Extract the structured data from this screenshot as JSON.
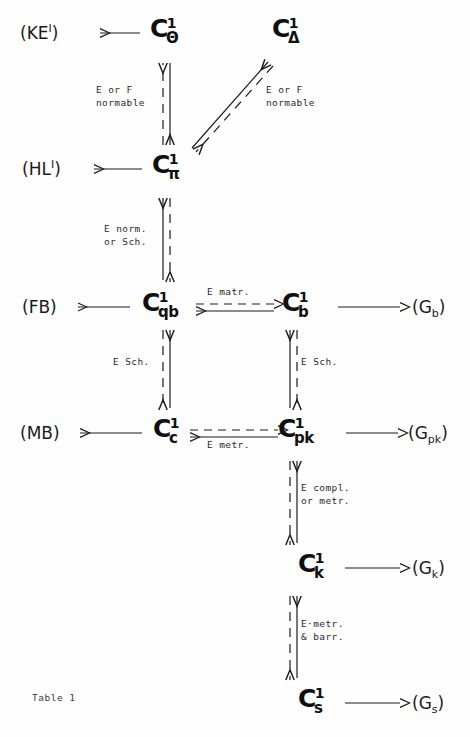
{
  "figure": {
    "caption": "Table 1",
    "ink_color": "#1a1a1a",
    "background": "#fefefe"
  },
  "nodes": [
    {
      "id": "c-theta",
      "base": "C",
      "sup": "1",
      "sub": "Θ",
      "x": 150,
      "y": 16
    },
    {
      "id": "c-delta",
      "base": "C",
      "sup": "1",
      "sub": "Δ",
      "x": 272,
      "y": 16
    },
    {
      "id": "c-pi",
      "base": "C",
      "sup": "1",
      "sub": "π",
      "x": 152,
      "y": 152
    },
    {
      "id": "c-qb",
      "base": "C",
      "sup": "1",
      "sub": "qb",
      "x": 142,
      "y": 290
    },
    {
      "id": "c-b",
      "base": "C",
      "sup": "1",
      "sub": "b",
      "x": 282,
      "y": 290
    },
    {
      "id": "c-c",
      "base": "C",
      "sup": "1",
      "sub": "c",
      "x": 153,
      "y": 416
    },
    {
      "id": "c-pk",
      "base": "C",
      "sup": "1",
      "sub": "pk",
      "x": 278,
      "y": 416
    },
    {
      "id": "c-k",
      "base": "C",
      "sup": "1",
      "sub": "k",
      "x": 298,
      "y": 551
    },
    {
      "id": "c-s",
      "base": "C",
      "sup": "1",
      "sub": "s",
      "x": 298,
      "y": 686
    }
  ],
  "side_labels": [
    {
      "id": "ke",
      "text": "(KE",
      "sup": "I",
      "tail": ")",
      "x": 20,
      "y": 25
    },
    {
      "id": "hl",
      "text": "(HL",
      "sup": "I",
      "tail": ")",
      "x": 22,
      "y": 161
    },
    {
      "id": "fb",
      "text": "(FB)",
      "sup": "",
      "tail": "",
      "x": 22,
      "y": 299
    },
    {
      "id": "mb",
      "text": "(MB)",
      "sup": "",
      "tail": "",
      "x": 20,
      "y": 425
    },
    {
      "id": "gb",
      "text": "(G",
      "sub": "b",
      "tail": ")",
      "x": 412,
      "y": 299
    },
    {
      "id": "gpk",
      "text": "(G",
      "sub": "pk",
      "tail": ")",
      "x": 408,
      "y": 425
    },
    {
      "id": "gk",
      "text": "(G",
      "sub": "k",
      "tail": ")",
      "x": 412,
      "y": 560
    },
    {
      "id": "gs",
      "text": "(G",
      "sub": "s",
      "tail": ")",
      "x": 412,
      "y": 695
    }
  ],
  "edge_labels": [
    {
      "id": "theta-pi",
      "line1": "E or F",
      "line2": "normable",
      "x": 96,
      "y": 83,
      "align": "left"
    },
    {
      "id": "delta-pi",
      "line1": "E or F",
      "line2": "normable",
      "x": 266,
      "y": 83,
      "align": "left"
    },
    {
      "id": "pi-qb",
      "line1": "E norm.",
      "line2": "or Sch.",
      "x": 104,
      "y": 222,
      "align": "left"
    },
    {
      "id": "qb-b",
      "line1": "E matr.",
      "line2": "",
      "x": 207,
      "y": 285,
      "align": "left"
    },
    {
      "id": "qb-c",
      "line1": "E Sch.",
      "line2": "",
      "x": 113,
      "y": 355,
      "align": "left"
    },
    {
      "id": "b-pk",
      "line1": "E Sch.",
      "line2": "",
      "x": 301,
      "y": 355,
      "align": "left"
    },
    {
      "id": "c-pk-h",
      "line1": "E metr.",
      "line2": "",
      "x": 207,
      "y": 438,
      "align": "left"
    },
    {
      "id": "pk-k",
      "line1": "E compl.",
      "line2": "or metr.",
      "x": 301,
      "y": 481,
      "align": "left"
    },
    {
      "id": "k-s",
      "line1": "E·metr.",
      "line2": "& barr.",
      "x": 301,
      "y": 617,
      "align": "left"
    }
  ],
  "arrows": [
    {
      "id": "c-theta-to-ke",
      "kind": "plain-left",
      "desc": "C1-theta to (KE)"
    },
    {
      "id": "c-pi-to-hl",
      "kind": "plain-left",
      "desc": "C1-pi to (HL)"
    },
    {
      "id": "c-qb-to-fb",
      "kind": "plain-left",
      "desc": "C1-qb to (FB)"
    },
    {
      "id": "c-c-to-mb",
      "kind": "plain-left",
      "desc": "C1-c to (MB)"
    },
    {
      "id": "c-b-to-gb",
      "kind": "plain-right",
      "desc": "C1-b to (Gb)"
    },
    {
      "id": "c-pk-to-gpk",
      "kind": "plain-right",
      "desc": "C1-pk to (Gpk)"
    },
    {
      "id": "c-k-to-gk",
      "kind": "plain-right",
      "desc": "C1-k to (Gk)"
    },
    {
      "id": "c-s-to-gs",
      "kind": "plain-right",
      "desc": "C1-s to (Gs)"
    },
    {
      "id": "theta-pi",
      "kind": "double-vertical-solid-dashed",
      "desc": "C1-theta <-> C1-pi"
    },
    {
      "id": "delta-pi",
      "kind": "double-diagonal-solid-dashed",
      "desc": "C1-delta <-> C1-pi"
    },
    {
      "id": "pi-qb",
      "kind": "double-vertical-solid-dashed",
      "desc": "C1-pi <-> C1-qb"
    },
    {
      "id": "qb-b",
      "kind": "double-horizontal-solid-dashed",
      "desc": "C1-qb <-> C1-b"
    },
    {
      "id": "qb-c",
      "kind": "double-vertical-solid-dashed",
      "desc": "C1-qb <-> C1-c"
    },
    {
      "id": "b-pk",
      "kind": "double-vertical-solid-dashed",
      "desc": "C1-b <-> C1-pk"
    },
    {
      "id": "c-pk",
      "kind": "double-horizontal-solid-dashed",
      "desc": "C1-c <-> C1-pk"
    },
    {
      "id": "pk-k",
      "kind": "double-vertical-solid-dashed",
      "desc": "C1-pk <-> C1-k"
    },
    {
      "id": "k-s",
      "kind": "double-vertical-solid-dashed",
      "desc": "C1-k <-> C1-s"
    }
  ]
}
